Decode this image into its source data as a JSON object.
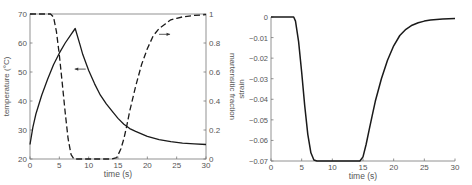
{
  "chart_data": [
    {
      "type": "line",
      "title": "",
      "xlabel": "time (s)",
      "ylabel": "temperature (°C)",
      "ylabel_right": "martensitic fraction",
      "xlim": [
        0,
        30
      ],
      "ylim": [
        20,
        70
      ],
      "ylim_right": [
        0,
        1
      ],
      "xticks": [
        0,
        5,
        10,
        15,
        20,
        25,
        30
      ],
      "yticks": [
        20,
        30,
        40,
        50,
        60,
        70
      ],
      "yticks_right": [
        0,
        0.2,
        0.4,
        0.6,
        0.8,
        1
      ],
      "ytick_labels_right": [
        "0",
        "0.2",
        "0.4",
        "0.6",
        "0.8",
        "1"
      ],
      "grid": false,
      "series": [
        {
          "name": "temperature",
          "axis": "left",
          "style": "solid",
          "x": [
            0,
            0.5,
            1,
            2,
            3,
            4,
            5,
            6,
            7,
            7.7,
            8.5,
            9,
            10,
            11,
            12,
            13,
            14,
            15,
            16,
            17,
            18,
            20,
            22,
            24,
            26,
            28,
            30
          ],
          "y": [
            25,
            31,
            35.5,
            42,
            47.5,
            52.5,
            56.5,
            60,
            63,
            65,
            59.5,
            56,
            50.5,
            46,
            42,
            39,
            36.5,
            34,
            32,
            30.5,
            29.5,
            27.8,
            26.7,
            26,
            25.5,
            25.2,
            25
          ]
        },
        {
          "name": "martensitic fraction",
          "axis": "right",
          "style": "dashed",
          "x": [
            0,
            3.5,
            4,
            4.5,
            5,
            5.5,
            6,
            6.5,
            7,
            7.5,
            10,
            14,
            14.8,
            15.5,
            16,
            16.5,
            17,
            18,
            19,
            20,
            21,
            22,
            23,
            24,
            25,
            26,
            28,
            30
          ],
          "y": [
            1,
            1,
            0.98,
            0.88,
            0.72,
            0.52,
            0.32,
            0.14,
            0.03,
            0,
            0,
            0,
            0.01,
            0.07,
            0.14,
            0.23,
            0.33,
            0.5,
            0.65,
            0.76,
            0.85,
            0.9,
            0.93,
            0.96,
            0.97,
            0.98,
            0.99,
            0.995
          ]
        }
      ],
      "annotations": [
        {
          "type": "arrow",
          "direction": "left",
          "x": 9.5,
          "y": 51,
          "points_to": "temperature"
        },
        {
          "type": "arrow",
          "direction": "right",
          "x": 22,
          "y_right": 0.86,
          "points_to": "martensitic fraction"
        }
      ]
    },
    {
      "type": "line",
      "title": "",
      "xlabel": "time (s)",
      "ylabel": "strain",
      "xlim": [
        0,
        30
      ],
      "ylim": [
        -0.07,
        0
      ],
      "xticks": [
        0,
        5,
        10,
        15,
        20,
        25,
        30
      ],
      "yticks": [
        0,
        -0.01,
        -0.02,
        -0.03,
        -0.04,
        -0.05,
        -0.06,
        -0.07
      ],
      "ytick_labels": [
        "0",
        "−0.01",
        "−0.02",
        "−0.03",
        "−0.04",
        "−0.05",
        "−0.06",
        "−0.07"
      ],
      "grid": false,
      "series": [
        {
          "name": "strain",
          "style": "solid",
          "x": [
            0,
            3.7,
            4,
            4.5,
            5,
            5.5,
            6,
            6.5,
            7,
            7.5,
            10,
            14.5,
            15,
            15.5,
            16,
            16.5,
            17,
            18,
            19,
            20,
            21,
            22,
            23,
            24,
            25,
            26,
            28,
            30
          ],
          "y": [
            0,
            0,
            -0.002,
            -0.012,
            -0.027,
            -0.043,
            -0.057,
            -0.066,
            -0.0695,
            -0.07,
            -0.07,
            -0.07,
            -0.068,
            -0.062,
            -0.055,
            -0.048,
            -0.041,
            -0.03,
            -0.021,
            -0.014,
            -0.009,
            -0.006,
            -0.004,
            -0.0028,
            -0.002,
            -0.0015,
            -0.001,
            -0.0008
          ]
        }
      ]
    }
  ]
}
